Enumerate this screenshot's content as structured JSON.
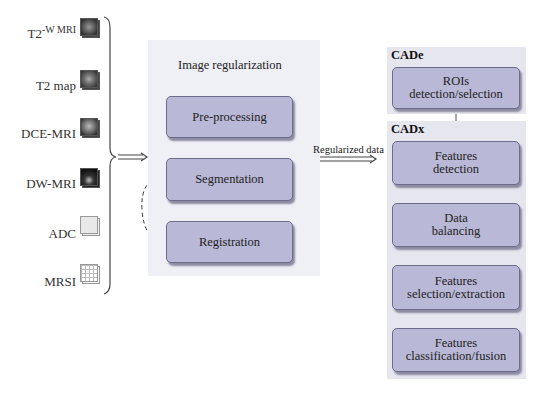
{
  "inputs": {
    "items": [
      {
        "label": "T2-W MRI",
        "icon": "mri-slice-icon"
      },
      {
        "label": "T2 map",
        "icon": "mri-slice-icon"
      },
      {
        "label": "DCE-MRI",
        "icon": "mri-slice-icon"
      },
      {
        "label": "DW-MRI",
        "icon": "mri-slice-icon"
      },
      {
        "label": "ADC",
        "icon": "map-icon"
      },
      {
        "label": "MRSI",
        "icon": "grid-icon"
      }
    ]
  },
  "regularization": {
    "title": "Image regularization",
    "steps": [
      "Pre-processing",
      "Segmentation",
      "Registration"
    ]
  },
  "connector": {
    "label": "Regularized data"
  },
  "cade": {
    "title": "CADe",
    "steps": [
      "ROIs\ndetection/selection"
    ]
  },
  "cadx": {
    "title": "CADx",
    "steps": [
      "Features\ndetection",
      "Data\nbalancing",
      "Features\nselection/extraction",
      "Features\nclassification/fusion"
    ]
  },
  "colors": {
    "box_fill": "#b9b8d6",
    "box_border": "#6e6c8e",
    "panel_bg": "#efeff6"
  }
}
